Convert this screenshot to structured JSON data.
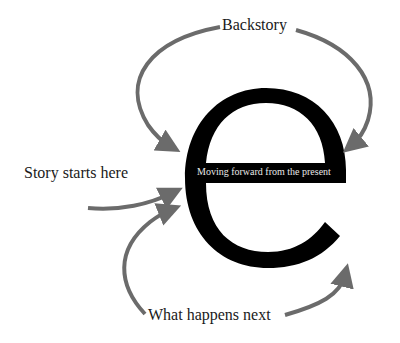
{
  "diagram": {
    "letter": "e",
    "crossbar_label": "Moving forward from the present",
    "labels": {
      "backstory": "Backstory",
      "story_starts": "Story starts here",
      "what_happens_next": "What happens next"
    },
    "colors": {
      "letter": "#000000",
      "arrows": "#6b6b6b",
      "text": "#1a1a1a",
      "crossbar_text": "#e8e8e8",
      "background": "#ffffff"
    }
  }
}
